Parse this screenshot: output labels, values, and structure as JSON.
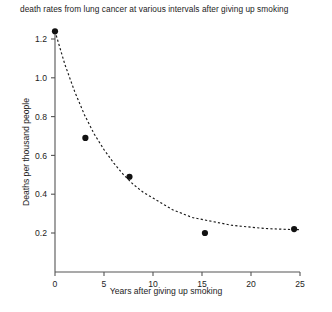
{
  "chart_data": {
    "type": "scatter",
    "title": "death rates from lung cancer at various intervals after giving up smoking",
    "xlabel": "Years after giving up smoking",
    "ylabel": "Deaths per thousand people",
    "xlim": [
      0,
      25
    ],
    "ylim": [
      0,
      1.3
    ],
    "xticks": [
      0,
      5,
      10,
      15,
      20,
      25
    ],
    "xtick_labels": [
      "0",
      "5",
      "10",
      "15",
      "20",
      "25"
    ],
    "yticks": [
      0.2,
      0.4,
      0.6,
      0.8,
      1.0,
      1.2
    ],
    "ytick_labels": [
      "0.2",
      "0.4",
      "0.6",
      "0.8",
      "1.0",
      "1.2"
    ],
    "grid": false,
    "legend": "none",
    "series": [
      {
        "name": "observed death rates",
        "marker": "filled-circle",
        "color": "#111111",
        "x": [
          0,
          3.1,
          7.6,
          15.3,
          24.4
        ],
        "y": [
          1.24,
          0.69,
          0.49,
          0.2,
          0.22
        ]
      },
      {
        "name": "fitted exponential decay curve",
        "style": "dashed",
        "color": "#1a1a1a",
        "x": [
          0,
          1,
          2,
          3,
          4,
          5,
          6,
          7,
          8,
          9,
          10,
          11,
          12,
          13,
          14,
          15,
          16,
          17,
          18,
          19,
          20,
          21,
          22,
          23,
          24,
          25
        ],
        "y": [
          1.24,
          1.07,
          0.93,
          0.81,
          0.71,
          0.63,
          0.56,
          0.5,
          0.45,
          0.41,
          0.38,
          0.35,
          0.32,
          0.3,
          0.28,
          0.27,
          0.26,
          0.25,
          0.24,
          0.235,
          0.23,
          0.225,
          0.222,
          0.22,
          0.218,
          0.217
        ]
      }
    ]
  },
  "figure": {
    "background_color": "#ffffff",
    "axis_color": "#555555",
    "text_color": "#1d1d1d"
  }
}
